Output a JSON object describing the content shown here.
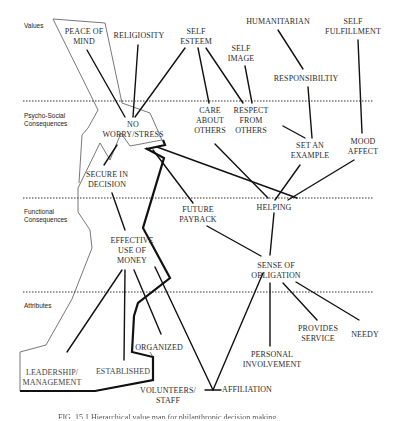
{
  "levels": {
    "values": "Values",
    "psycho_social": "Psycho-Social\nConsequences",
    "functional": "Functional\nConsequences",
    "attributes": "Attributes"
  },
  "nodes": {
    "peace_of_mind": "PEACE OF\nMIND",
    "religiosity": "RELIGIOSITY",
    "self_esteem": "SELF\nESTEEM",
    "humanitarian": "HUMANITARIAN",
    "self_fulfillment": "SELF\nFULFILLMENT",
    "self_image": "SELF\nIMAGE",
    "responsibility": "RESPONSIBILTIY",
    "no_worry_stress": "NO\nWORRY/STRESS",
    "care_about_others": "CARE\nABOUT\nOTHERS",
    "respect_from_others": "RESPECT\nFROM\nOTHERS",
    "set_an_example": "SET AN\nEXAMPLE",
    "mood_affect": "MOOD\nAFFECT",
    "secure_in_decision": "SECURE IN\nDECISION",
    "future_payback": "FUTURE\nPAYBACK",
    "helping": "HELPING",
    "effective_use_of_money": "EFFECTIVE\nUSE OF\nMONEY",
    "sense_of_obligation": "SENSE OF\nOBLIGATION",
    "organized": "ORGANIZED",
    "provides_service": "PROVIDES\nSERVICE",
    "needy": "NEEDY",
    "personal_involvement": "PERSONAL\nINVOLVEMENT",
    "leadership_management": "LEADERSHIP/\nMANAGEMENT",
    "established": "ESTABLISHED",
    "volunteers_staff": "VOLUNTEERS/\nSTAFF",
    "affiliation": "AFFILIATION"
  },
  "caption": "FIG. 15.1  Hierarchical value map for philanthropic decision making.",
  "colors": {
    "line": "#111111",
    "outline": "#444444",
    "text": "#2a2a2a",
    "divider": "#333333"
  }
}
